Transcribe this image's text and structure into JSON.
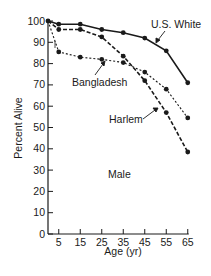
{
  "chart_data": {
    "type": "line",
    "title": "",
    "xlabel": "Age (yr)",
    "ylabel": "Percent Alive",
    "annotation": "Male",
    "x": [
      0,
      5,
      15,
      25,
      35,
      45,
      55,
      65
    ],
    "x_ticks": [
      5,
      15,
      25,
      35,
      45,
      55,
      65
    ],
    "y_ticks": [
      0,
      10,
      20,
      30,
      40,
      50,
      60,
      70,
      80,
      90,
      100
    ],
    "xlim": [
      0,
      65
    ],
    "ylim": [
      0,
      100
    ],
    "grid": false,
    "legend": "inline labels with arrows",
    "series": [
      {
        "name": "U.S. White",
        "style": "solid",
        "values": [
          100,
          98.5,
          98.5,
          96,
          94.5,
          92,
          86,
          71
        ]
      },
      {
        "name": "Bangladesh",
        "style": "dotted",
        "values": [
          100,
          85.5,
          83,
          82,
          80.5,
          76,
          68,
          54.5
        ]
      },
      {
        "name": "Harlem",
        "style": "dashed",
        "values": [
          100,
          96,
          96,
          92.5,
          83.5,
          72,
          57,
          38.5
        ]
      }
    ]
  },
  "labels": {
    "us_white": "U.S. White",
    "bangladesh": "Bangladesh",
    "harlem": "Harlem",
    "male": "Male",
    "xlabel": "Age (yr)",
    "ylabel": "Percent Alive"
  },
  "colors": {
    "ink": "#1a1a1a",
    "background": "#ffffff"
  }
}
